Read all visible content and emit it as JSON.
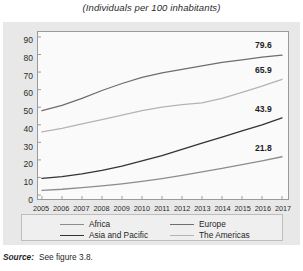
{
  "figure": {
    "title": "(Individuals per 100 inhabitants)",
    "source_label": "Source:",
    "source_text": "See figure 3.8."
  },
  "colors": {
    "panel_bg": "#e8e8e8",
    "plot_bg": "#fafafa",
    "plot_border": "#9a9a9a",
    "europe": "#6e6e6e",
    "the_americas": "#b4b4b4",
    "asia_and_pacific": "#333333",
    "africa": "#8c8c8c",
    "text": "#1f1f1f"
  },
  "legend": {
    "position": "bottom",
    "items": [
      {
        "label": "Africa",
        "color": "#8c8c8c"
      },
      {
        "label": "Asia and Pacific",
        "color": "#333333"
      },
      {
        "label": "Europe",
        "color": "#6e6e6e"
      },
      {
        "label": "The Americas",
        "color": "#b4b4b4"
      }
    ]
  },
  "chart_data": {
    "type": "line",
    "title": "(Individuals per 100 inhabitants)",
    "xlabel": "",
    "ylabel": "",
    "grid": false,
    "ylim": [
      0,
      90
    ],
    "yticks": [
      0,
      10,
      20,
      30,
      40,
      50,
      60,
      70,
      80,
      90
    ],
    "x": [
      2005,
      2006,
      2007,
      2008,
      2009,
      2010,
      2011,
      2012,
      2013,
      2014,
      2015,
      2016,
      2017
    ],
    "categories": [
      "2005",
      "2006",
      "2007",
      "2008",
      "2009",
      "2010",
      "2011",
      "2012",
      "2013",
      "2014",
      "2015",
      "2016",
      "2017"
    ],
    "series": [
      {
        "name": "Europe",
        "color": "#6e6e6e",
        "values": [
          48.0,
          51.0,
          55.0,
          59.5,
          63.5,
          67.0,
          69.5,
          71.5,
          73.5,
          75.5,
          77.0,
          78.5,
          79.6
        ],
        "end_label": "79.6"
      },
      {
        "name": "The Americas",
        "color": "#b4b4b4",
        "values": [
          36.0,
          38.0,
          40.5,
          43.0,
          45.5,
          48.0,
          50.0,
          51.5,
          52.5,
          55.0,
          58.5,
          62.0,
          65.9
        ],
        "end_label": "65.9"
      },
      {
        "name": "Asia and Pacific",
        "color": "#333333",
        "values": [
          9.5,
          10.5,
          12.0,
          14.0,
          16.5,
          19.5,
          22.5,
          26.0,
          29.5,
          33.0,
          36.5,
          40.0,
          43.9
        ],
        "end_label": "43.9"
      },
      {
        "name": "Africa",
        "color": "#8c8c8c",
        "values": [
          2.7,
          3.3,
          4.2,
          5.2,
          6.4,
          7.8,
          9.4,
          11.2,
          13.2,
          15.2,
          17.3,
          19.5,
          21.8
        ],
        "end_label": "21.8"
      }
    ]
  }
}
